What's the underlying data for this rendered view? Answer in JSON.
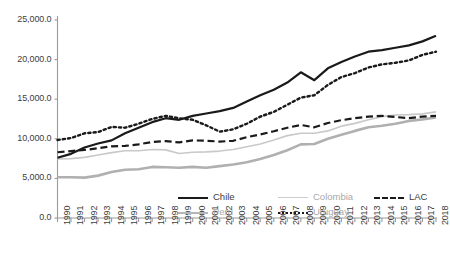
{
  "chart_data": {
    "type": "line",
    "title": "",
    "subtitle": "",
    "xlabel": "",
    "ylabel": "",
    "grid": false,
    "legend_position": "bottom",
    "xlim": [
      1990,
      2018
    ],
    "ylim": [
      0,
      25000
    ],
    "y_ticks": [
      0,
      5000,
      10000,
      15000,
      20000,
      25000
    ],
    "y_tick_labels": [
      "0.0",
      "5,000.0",
      "10,000.0",
      "15,000.0",
      "20,000.0",
      "25,000.0"
    ],
    "categories": [
      1990,
      1991,
      1992,
      1993,
      1994,
      1995,
      1996,
      1997,
      1998,
      1999,
      2000,
      2001,
      2002,
      2003,
      2004,
      2005,
      2006,
      2007,
      2008,
      2009,
      2010,
      2011,
      2012,
      2013,
      2014,
      2015,
      2016,
      2017,
      2018
    ],
    "x_tick_labels": [
      "1990",
      "1991",
      "1992",
      "1993",
      "1994",
      "1995",
      "1996",
      "1997",
      "1998",
      "1999",
      "2000",
      "2001",
      "2002",
      "2003",
      "2004",
      "2005",
      "2006",
      "2007",
      "2008",
      "2009",
      "2010",
      "2011",
      "2012",
      "2013",
      "2014",
      "2015",
      "2016",
      "2017",
      "2018"
    ],
    "series": [
      {
        "name": "Chile",
        "style": "solid",
        "color": "#1a1a1a",
        "width": 2.2,
        "values": [
          7600,
          8100,
          8900,
          9400,
          9800,
          10700,
          11400,
          12100,
          12600,
          12400,
          12900,
          13200,
          13500,
          13900,
          14700,
          15500,
          16200,
          17100,
          18400,
          17400,
          18900,
          19700,
          20400,
          21000,
          21200,
          21500,
          21800,
          22300,
          23000
        ]
      },
      {
        "name": "Colombia",
        "style": "solid",
        "color": "#c9c9c9",
        "width": 1.6,
        "values": [
          7450,
          7500,
          7650,
          7950,
          8250,
          8500,
          8500,
          8650,
          8600,
          8150,
          8300,
          8350,
          8450,
          8650,
          9000,
          9350,
          9850,
          10400,
          10700,
          10700,
          11000,
          11600,
          11950,
          12400,
          12800,
          13000,
          13050,
          13150,
          13400
        ]
      },
      {
        "name": "LAC",
        "style": "dashed",
        "color": "#1a1a1a",
        "width": 2.2,
        "values": [
          8300,
          8450,
          8600,
          8800,
          9050,
          9100,
          9300,
          9600,
          9700,
          9550,
          9800,
          9750,
          9650,
          9750,
          10200,
          10550,
          10950,
          11400,
          11750,
          11450,
          12000,
          12350,
          12600,
          12800,
          12900,
          12750,
          12600,
          12800,
          12900
        ]
      },
      {
        "name": "Peru",
        "style": "solid",
        "color": "#b0b0b0",
        "width": 2.6,
        "values": [
          5150,
          5150,
          5100,
          5350,
          5800,
          6100,
          6150,
          6450,
          6400,
          6350,
          6450,
          6350,
          6550,
          6750,
          7050,
          7450,
          7950,
          8550,
          9300,
          9350,
          10000,
          10500,
          11000,
          11450,
          11650,
          11900,
          12250,
          12450,
          12700
        ]
      },
      {
        "name": "Uruguay",
        "style": "dotted",
        "color": "#1a1a1a",
        "width": 2.4,
        "values": [
          9850,
          10100,
          10700,
          10850,
          11500,
          11400,
          11900,
          12500,
          12900,
          12600,
          12400,
          11700,
          10900,
          11200,
          11900,
          12800,
          13400,
          14300,
          15200,
          15500,
          16800,
          17800,
          18300,
          19000,
          19400,
          19600,
          19900,
          20600,
          21000
        ]
      }
    ]
  },
  "legend": {
    "items": [
      {
        "label": "Chile",
        "dim": false
      },
      {
        "label": "Colombia",
        "dim": true
      },
      {
        "label": "LAC",
        "dim": false
      },
      {
        "label": "Peru",
        "dim": true
      },
      {
        "label": "Uruguay",
        "dim": true
      }
    ]
  },
  "axes": {
    "axis_color": "#9a9a9a"
  }
}
